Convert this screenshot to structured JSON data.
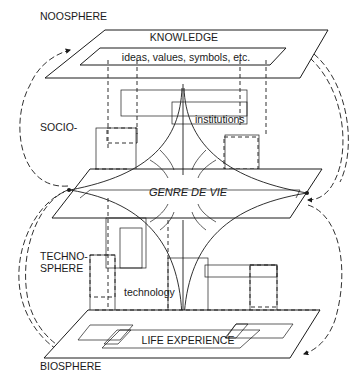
{
  "diagram": {
    "sphere_labels": {
      "noosphere": "NOOSPHERE",
      "socio": "SOCIO-",
      "techno_line1": "TECHNO-",
      "techno_line2": "SPHERE",
      "biosphere": "BIOSPHERE"
    },
    "planes": {
      "top": {
        "title": "KNOWLEDGE",
        "inner": "ideas, values, symbols, etc."
      },
      "middle": {
        "title": "GENRE DE VIE"
      },
      "bottom": {
        "title": "LIFE EXPERIENCE"
      }
    },
    "annotations": {
      "institutions": "institutions",
      "technology": "technology"
    },
    "colors": {
      "ink": "#1a1a1a",
      "paper": "#ffffff"
    }
  }
}
